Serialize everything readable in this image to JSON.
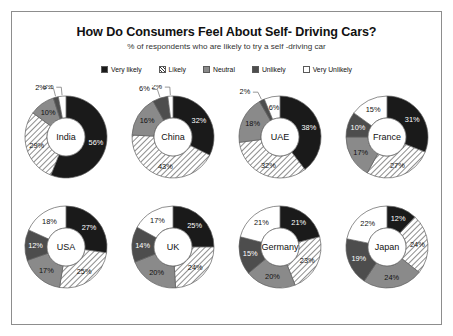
{
  "chart_data": {
    "type": "pie",
    "title": "How Do Consumers Feel About Self- Driving Cars?",
    "subtitle": "% of respondents who are likely to try a self -driving car",
    "legend_position": "top",
    "legend": [
      {
        "label": "Very likely",
        "color": "#1a1a1a",
        "pattern": "solid"
      },
      {
        "label": "Likely",
        "color": "#ffffff",
        "pattern": "diagonal-hatch"
      },
      {
        "label": "Neutral",
        "color": "#8a8a8a",
        "pattern": "solid"
      },
      {
        "label": "Unlikely",
        "color": "#4d4d4d",
        "pattern": "solid"
      },
      {
        "label": "Very Unlikely",
        "color": "#ffffff",
        "pattern": "solid"
      }
    ],
    "categories": [
      "Very likely",
      "Likely",
      "Neutral",
      "Unlikely",
      "Very Unlikely"
    ],
    "series": [
      {
        "name": "India",
        "values": [
          56,
          29,
          10,
          2,
          3
        ],
        "labels": [
          "56%",
          "29%",
          "10%",
          "2%",
          "3%"
        ]
      },
      {
        "name": "China",
        "values": [
          32,
          43,
          16,
          6,
          2
        ],
        "labels": [
          "32%",
          "43%",
          "16%",
          "6%",
          "2%"
        ]
      },
      {
        "name": "UAE",
        "values": [
          38,
          32,
          18,
          2,
          6
        ],
        "labels": [
          "38%",
          "32%",
          "18%",
          "2%",
          "6%"
        ]
      },
      {
        "name": "France",
        "values": [
          31,
          27,
          17,
          10,
          15
        ],
        "labels": [
          "31%",
          "27%",
          "17%",
          "10%",
          "15%"
        ]
      },
      {
        "name": "USA",
        "values": [
          27,
          25,
          17,
          12,
          18
        ],
        "labels": [
          "27%",
          "25%",
          "17%",
          "12%",
          "18%"
        ]
      },
      {
        "name": "UK",
        "values": [
          25,
          24,
          20,
          14,
          17
        ],
        "labels": [
          "25%",
          "24%",
          "20%",
          "14%",
          "17%"
        ]
      },
      {
        "name": "Germany",
        "values": [
          21,
          23,
          20,
          15,
          21
        ],
        "labels": [
          "21%",
          "23%",
          "20%",
          "15%",
          "21%"
        ]
      },
      {
        "name": "Japan",
        "values": [
          12,
          24,
          24,
          19,
          22
        ],
        "labels": [
          "12%",
          "24%",
          "24%",
          "19%",
          "22%"
        ]
      }
    ]
  }
}
